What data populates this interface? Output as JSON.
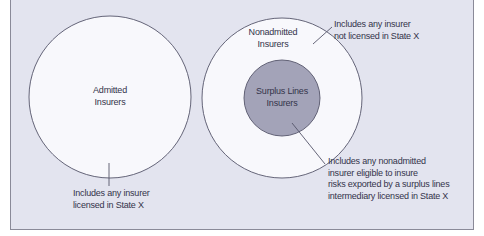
{
  "diagram": {
    "type": "venn",
    "colors": {
      "background": "#e3e4ef",
      "circle_fill": "#f8f8fc",
      "inner_circle_fill": "#a3a3b8",
      "stroke": "#55556a",
      "text": "#33334a"
    },
    "admitted": {
      "label_line1": "Admitted",
      "label_line2": "Insurers",
      "note_line1": "Includes any insurer",
      "note_line2": "licensed in State X"
    },
    "nonadmitted": {
      "label_line1": "Nonadmitted",
      "label_line2": "Insurers",
      "note_line1": "Includes any insurer",
      "note_line2": "not licensed in State X"
    },
    "surplus_lines": {
      "label_line1": "Surplus Lines",
      "label_line2": "Insurers",
      "note_line1": "Includes any nonadmitted",
      "note_line2": "insurer eligible to insure",
      "note_line3": "risks exported by a surplus lines",
      "note_line4": "intermediary licensed in State X"
    }
  }
}
